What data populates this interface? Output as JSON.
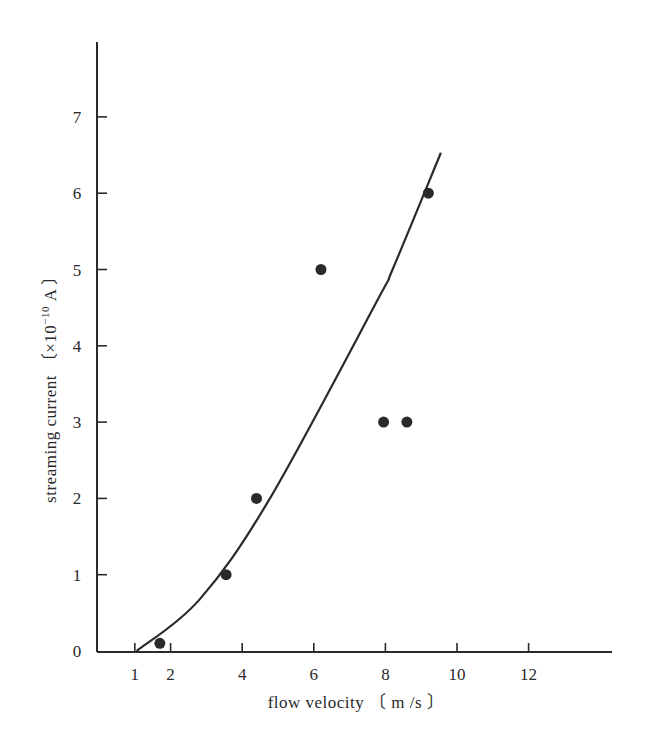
{
  "chart_data": {
    "type": "scatter",
    "title": "",
    "xlabel": "flow velocity 〔 m /s 〕",
    "ylabel": "streaming current 〔×10⁻¹⁰ A 〕",
    "xlim": [
      0,
      14
    ],
    "ylim": [
      0,
      8
    ],
    "x_ticks": [
      1,
      2,
      4,
      6,
      8,
      10,
      12
    ],
    "y_ticks": [
      0,
      1,
      2,
      3,
      4,
      5,
      6,
      7
    ],
    "grid": false,
    "legend": null,
    "series": [
      {
        "name": "measured",
        "kind": "scatter",
        "points": [
          {
            "x": 1.7,
            "y": 0.1
          },
          {
            "x": 3.55,
            "y": 1.0
          },
          {
            "x": 4.4,
            "y": 2.0
          },
          {
            "x": 6.2,
            "y": 5.0
          },
          {
            "x": 7.95,
            "y": 3.0
          },
          {
            "x": 8.6,
            "y": 3.0
          },
          {
            "x": 9.2,
            "y": 6.0
          }
        ]
      },
      {
        "name": "fitted curve",
        "kind": "line",
        "points": [
          {
            "x": 1.05,
            "y": 0.0
          },
          {
            "x": 2.8,
            "y": 0.67
          },
          {
            "x": 4.75,
            "y": 1.98
          },
          {
            "x": 7.78,
            "y": 4.6
          },
          {
            "x": 8.2,
            "y": 5.0
          },
          {
            "x": 9.55,
            "y": 6.53
          }
        ]
      }
    ]
  },
  "labels": {
    "xlabel": "flow velocity 〔 m /s 〕",
    "ylabel_main": "streaming current 〔×10",
    "ylabel_exp": "−10",
    "ylabel_tail": " A 〕",
    "x_ticks": [
      "1",
      "2",
      "4",
      "6",
      "8",
      "10",
      "12"
    ],
    "y_ticks": [
      "0",
      "1",
      "2",
      "3",
      "4",
      "5",
      "6",
      "7"
    ]
  },
  "colors": {
    "ink": "#2a2a2a",
    "background": "#ffffff"
  }
}
